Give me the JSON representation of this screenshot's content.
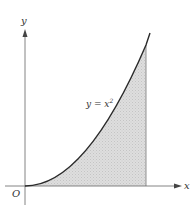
{
  "diagram": {
    "axes": {
      "x_label": "x",
      "y_label": "y",
      "origin_label": "O"
    },
    "curve": {
      "equation_prefix": "y = x",
      "equation_exponent": "2"
    },
    "colors": {
      "axis": "#555555",
      "curve": "#2a2a2a",
      "fill": "#d9d9d9",
      "background": "#ffffff"
    }
  }
}
